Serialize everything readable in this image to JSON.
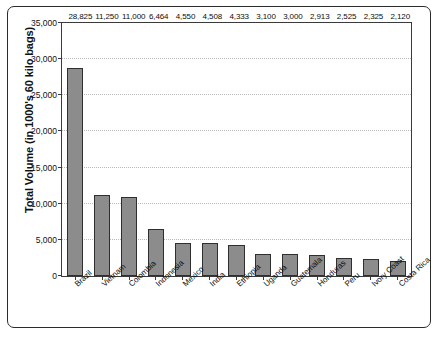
{
  "chart_data": {
    "type": "bar",
    "title": "",
    "xlabel": "",
    "ylabel": "Total Volume (in 1000's 60 kilo bags)",
    "ylim": [
      0,
      35000
    ],
    "yticks": [
      "0",
      "5,000",
      "10,000",
      "15,000",
      "20,000",
      "25,000",
      "30,000",
      "35,000"
    ],
    "ytick_values": [
      0,
      5000,
      10000,
      15000,
      20000,
      25000,
      30000,
      35000
    ],
    "grid": "horizontal-dotted",
    "legend": "none",
    "bar_color": "#8c8c8c",
    "bar_border_color": "#2f2f2f",
    "categories": [
      "Brazil",
      "Vietnam",
      "Colombia",
      "Indonesia",
      "Mexico",
      "India",
      "Ethiopia",
      "Uganda",
      "Guatemala",
      "Honduras",
      "Peru",
      "Ivory Coast",
      "Costa Rica"
    ],
    "values": [
      28825,
      11250,
      11000,
      6464,
      4550,
      4508,
      4333,
      3100,
      3000,
      2913,
      2525,
      2325,
      2120
    ],
    "value_labels": [
      "28,825",
      "11,250",
      "11,000",
      "6,464",
      "4,550",
      "4,508",
      "4,333",
      "3,100",
      "3,000",
      "2,913",
      "2,525",
      "2,325",
      "2,120"
    ]
  }
}
